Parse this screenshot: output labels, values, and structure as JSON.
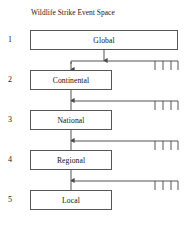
{
  "title": "Wildlife Strike Event Space",
  "diagram": {
    "type": "hierarchy",
    "orientation": "vertical-top-down",
    "level_count": 5,
    "levels": [
      {
        "number": "1",
        "label": "Global",
        "box": {
          "x": 30,
          "y": 30,
          "w": 148,
          "h": 20
        },
        "number_x": 8,
        "number_y": 35
      },
      {
        "number": "2",
        "label": "Continental",
        "box": {
          "x": 30,
          "y": 70,
          "w": 82,
          "h": 20
        },
        "number_x": 8,
        "number_y": 75
      },
      {
        "number": "3",
        "label": "National",
        "box": {
          "x": 30,
          "y": 110,
          "w": 82,
          "h": 20
        },
        "number_x": 8,
        "number_y": 115
      },
      {
        "number": "4",
        "label": "Regional",
        "box": {
          "x": 30,
          "y": 150,
          "w": 82,
          "h": 20
        },
        "number_x": 8,
        "number_y": 155
      },
      {
        "number": "5",
        "label": "Local",
        "box": {
          "x": 30,
          "y": 190,
          "w": 82,
          "h": 20
        },
        "number_x": 8,
        "number_y": 195
      }
    ],
    "connectors": [
      {
        "from": "Global",
        "to": "Continental",
        "style": "split-branch",
        "stem_x": 104,
        "stem_top": 50,
        "stem_bottom": 58,
        "rail_y": 61,
        "rail_x_start": 71,
        "rail_x_end": 178,
        "drop_x": 71,
        "drop_bottom": 70,
        "ticks_x": [
          155,
          163,
          171,
          178
        ],
        "tick_length": 9
      },
      {
        "from": "Continental",
        "to": "National",
        "style": "straight-with-rail",
        "stem_x": 71,
        "stem_top": 90,
        "stem_bottom": 110,
        "rail_y": 101,
        "rail_x_start": 71,
        "rail_x_end": 178,
        "ticks_x": [
          155,
          163,
          171,
          178
        ],
        "tick_length": 9
      },
      {
        "from": "National",
        "to": "Regional",
        "style": "straight-with-rail",
        "stem_x": 71,
        "stem_top": 130,
        "stem_bottom": 150,
        "rail_y": 141,
        "rail_x_start": 71,
        "rail_x_end": 178,
        "ticks_x": [
          155,
          163,
          171,
          178
        ],
        "tick_length": 9
      },
      {
        "from": "Regional",
        "to": "Local",
        "style": "straight-with-rail",
        "stem_x": 71,
        "stem_top": 170,
        "stem_bottom": 190,
        "rail_y": 181,
        "rail_x_start": 71,
        "rail_x_end": 178,
        "ticks_x": [
          155,
          163,
          171,
          178
        ],
        "tick_length": 9
      }
    ],
    "colors": {
      "line": "#555555",
      "box_border": "#555555",
      "box_fill": "#ffffff",
      "text": "#111111",
      "background": "#ffffff"
    }
  }
}
